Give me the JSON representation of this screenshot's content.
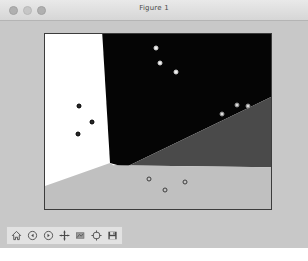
{
  "window": {
    "title": "Figure 1",
    "controls": [
      {
        "name": "close-button",
        "color": "#b0b0b0"
      },
      {
        "name": "minimize-button",
        "color": "#c6c6c6"
      },
      {
        "name": "zoom-button",
        "color": "#b0b0b0"
      }
    ],
    "background": "#c8c8c8"
  },
  "toolbar": {
    "buttons": [
      {
        "name": "home-icon",
        "label": "Home"
      },
      {
        "name": "back-arrow-icon",
        "label": "Back"
      },
      {
        "name": "forward-arrow-icon",
        "label": "Forward"
      },
      {
        "name": "pan-move-icon",
        "label": "Pan"
      },
      {
        "name": "zoom-rect-icon",
        "label": "Zoom to rectangle"
      },
      {
        "name": "configure-subplots-icon",
        "label": "Configure subplots"
      },
      {
        "name": "save-disk-icon",
        "label": "Save figure"
      }
    ]
  },
  "chart_data": {
    "type": "scatter",
    "title": "",
    "xlabel": "",
    "ylabel": "",
    "xlim": [
      -0.55,
      6.75
    ],
    "ylim": [
      -0.6,
      8.7
    ],
    "xticks": [
      0,
      1,
      2,
      3,
      4,
      5,
      6
    ],
    "yticks": [
      0,
      1,
      2,
      3,
      4,
      5,
      6,
      7,
      8
    ],
    "grid": false,
    "legend": null,
    "regions": [
      {
        "name": "region-white",
        "color": "#ffffff",
        "label": "class-0"
      },
      {
        "name": "region-black",
        "color": "#050505",
        "label": "class-1"
      },
      {
        "name": "region-dark-gray",
        "color": "#4a4a4a",
        "label": "class-2"
      },
      {
        "name": "region-light-gray",
        "color": "#c0c0c0",
        "label": "class-3"
      }
    ],
    "series": [
      {
        "name": "cluster-left-dark",
        "marker_face": "#262626",
        "marker_edge": "#000000",
        "points": [
          [
            0.56,
            4.87
          ],
          [
            0.97,
            4.0
          ],
          [
            0.5,
            3.37
          ]
        ]
      },
      {
        "name": "cluster-top-light",
        "marker_face": "#f2f2f2",
        "marker_edge": "#cfcfcf",
        "points": [
          [
            3.05,
            7.97
          ],
          [
            3.17,
            7.17
          ],
          [
            3.68,
            6.66
          ]
        ]
      },
      {
        "name": "cluster-right-light",
        "marker_face": "#dcdcdc",
        "marker_edge": "#8a8a8a",
        "points": [
          [
            5.18,
            4.44
          ],
          [
            5.65,
            4.92
          ],
          [
            6.01,
            4.9
          ]
        ]
      },
      {
        "name": "cluster-bottom-open",
        "marker_face": "#c4c4c4",
        "marker_edge": "#3c3c3c",
        "points": [
          [
            2.82,
            0.98
          ],
          [
            3.31,
            0.39
          ],
          [
            3.96,
            0.86
          ]
        ]
      }
    ]
  }
}
